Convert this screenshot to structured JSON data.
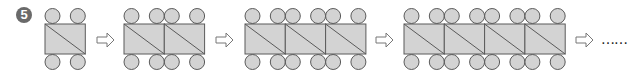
{
  "problem": {
    "number": "5"
  },
  "colors": {
    "fill": "#d3d3d3",
    "stroke": "#5a5a5a",
    "arrow_fill": "#ffffff",
    "badge": "#6a6a6a"
  },
  "figures": [
    {
      "squares": 1,
      "x": 45
    },
    {
      "squares": 2,
      "x": 124
    },
    {
      "squares": 3,
      "x": 245
    },
    {
      "squares": 4,
      "x": 404
    }
  ],
  "arrows": [
    {
      "x": 97
    },
    {
      "x": 216
    },
    {
      "x": 376
    },
    {
      "x": 576
    }
  ],
  "continuation": {
    "text": "……",
    "x": 601
  },
  "geometry": {
    "square_width": 40.3,
    "rect_top": 24,
    "rect_height": 30,
    "circle_r": 7.5,
    "circle_inset": 7.5,
    "top_circle_cy": 16,
    "bottom_circle_cy": 62
  }
}
